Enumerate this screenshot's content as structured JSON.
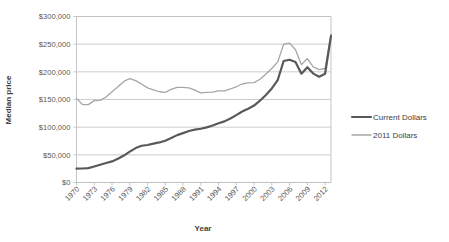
{
  "chart_data": {
    "type": "line",
    "title": "",
    "xlabel": "Year",
    "ylabel": "Median price",
    "ylim": [
      0,
      300000
    ],
    "xlim": [
      1970,
      2013
    ],
    "grid": true,
    "legend_position": "right",
    "ytick_labels": [
      "$300,000",
      "$250,000",
      "$200,000",
      "$150,000",
      "$100,000",
      "$50,000",
      "$0"
    ],
    "ytick_values": [
      300000,
      250000,
      200000,
      150000,
      100000,
      50000,
      0
    ],
    "xtick_labels": [
      "1970",
      "1973",
      "1976",
      "1979",
      "1982",
      "1985",
      "1988",
      "1991",
      "1994",
      "1997",
      "2000",
      "2003",
      "2006",
      "2009",
      "2012"
    ],
    "xtick_values": [
      1970,
      1973,
      1976,
      1979,
      1982,
      1985,
      1988,
      1991,
      1994,
      1997,
      2000,
      2003,
      2006,
      2009,
      2012
    ],
    "x": [
      1970,
      1971,
      1972,
      1973,
      1974,
      1975,
      1976,
      1977,
      1978,
      1979,
      1980,
      1981,
      1982,
      1983,
      1984,
      1985,
      1986,
      1987,
      1988,
      1989,
      1990,
      1991,
      1992,
      1993,
      1994,
      1995,
      1996,
      1997,
      1998,
      1999,
      2000,
      2001,
      2002,
      2003,
      2004,
      2005,
      2006,
      2007,
      2008,
      2009,
      2010,
      2011,
      2012,
      2013
    ],
    "series": [
      {
        "name": "Current Dollars",
        "color": "#595959",
        "width": 2.2,
        "values": [
          25000,
          25300,
          26000,
          28900,
          32000,
          35300,
          38100,
          42900,
          48700,
          55700,
          62200,
          66400,
          67800,
          70300,
          72400,
          75500,
          80300,
          85600,
          89300,
          93100,
          95500,
          97100,
          99700,
          103100,
          107200,
          110500,
          115800,
          121800,
          128400,
          133300,
          139000,
          147800,
          158100,
          170000,
          185200,
          219600,
          221900,
          217900,
          196600,
          208300,
          196800,
          191100,
          196500,
          265000
        ]
      },
      {
        "name": "2011 Dollars",
        "color": "#A6A6A6",
        "width": 1.3,
        "values": [
          152000,
          141000,
          140800,
          148000,
          148500,
          154500,
          164000,
          173000,
          182700,
          187900,
          184000,
          178000,
          171000,
          167500,
          164000,
          163000,
          168500,
          172000,
          172000,
          171000,
          167000,
          162000,
          163000,
          163500,
          165500,
          165500,
          169000,
          173000,
          178000,
          180000,
          180500,
          186500,
          196000,
          206000,
          218000,
          250000,
          252000,
          240000,
          213000,
          224000,
          209000,
          204000,
          206000,
          268000
        ]
      }
    ]
  },
  "axis": {
    "ylabel": "Median price",
    "xlabel": "Year"
  },
  "legend": {
    "items": [
      {
        "label": "Current Dollars",
        "color": "#595959"
      },
      {
        "label": "2011 Dollars",
        "color": "#A6A6A6"
      }
    ]
  }
}
